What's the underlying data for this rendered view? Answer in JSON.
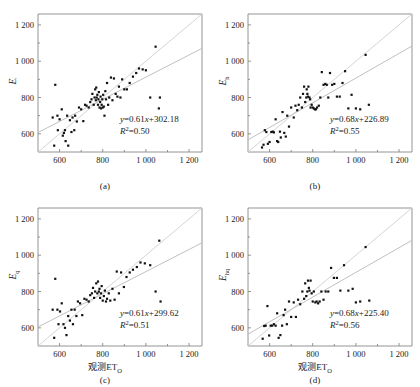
{
  "figure": {
    "axis": {
      "x_ticks": [
        "600",
        "800",
        "1 000",
        "1 200"
      ],
      "y_ticks": [
        "600",
        "800",
        "1 000",
        "1 200"
      ],
      "x_tick_values": [
        600,
        800,
        1000,
        1200
      ],
      "y_tick_values": [
        600,
        800,
        1000,
        1200
      ],
      "xlim": [
        500,
        1260
      ],
      "ylim": [
        500,
        1260
      ],
      "xlabel": "观测ET",
      "xlabel_sub": "O"
    },
    "panels": [
      {
        "id": "a",
        "caption": "(a)",
        "ylabel": "E",
        "ylabel_sub": "′",
        "equation": "y=0.61x+302.18",
        "r2": "R2=0.50",
        "r2_prefix": "R",
        "r2_value": "=0.50"
      },
      {
        "id": "b",
        "caption": "(b)",
        "ylabel": "E",
        "ylabel_sub": "h",
        "equation": "y=0.68x+226.89",
        "r2": "R2=0.55",
        "r2_prefix": "R",
        "r2_value": "=0.55"
      },
      {
        "id": "c",
        "caption": "(c)",
        "ylabel": "E",
        "ylabel_sub": "q",
        "equation": "y=0.61x+299.62",
        "r2": "R2=0.51",
        "r2_prefix": "R",
        "r2_value": "=0.51"
      },
      {
        "id": "d",
        "caption": "(d)",
        "ylabel": "E",
        "ylabel_sub": "hq",
        "equation": "y=0.68x+225.40",
        "r2": "R2=0.56",
        "r2_prefix": "R",
        "r2_value": "=0.56"
      }
    ]
  },
  "chart_data": [
    {
      "type": "scatter",
      "panel": "a",
      "title": "(a)",
      "xlabel": "观测ET_O",
      "ylabel": "E′",
      "xlim": [
        500,
        1260
      ],
      "ylim": [
        500,
        1260
      ],
      "xticks": [
        600,
        800,
        1000,
        1200
      ],
      "yticks": [
        600,
        800,
        1000,
        1200
      ],
      "grid": false,
      "legend": "none",
      "fit": {
        "slope": 0.61,
        "intercept": 302.18,
        "r2": 0.5,
        "label": "y=0.61x+302.18"
      },
      "identity_line": true,
      "x": [
        568,
        575,
        580,
        590,
        592,
        600,
        610,
        615,
        620,
        625,
        628,
        635,
        640,
        648,
        655,
        660,
        668,
        672,
        680,
        690,
        700,
        710,
        718,
        725,
        735,
        742,
        748,
        752,
        758,
        762,
        765,
        768,
        770,
        772,
        775,
        778,
        780,
        782,
        785,
        788,
        790,
        792,
        795,
        798,
        800,
        802,
        805,
        808,
        812,
        815,
        820,
        825,
        830,
        838,
        845,
        852,
        860,
        868,
        875,
        882,
        890,
        900,
        912,
        925,
        940,
        955,
        968,
        985,
        1000,
        1020,
        1045,
        1060,
        1065
      ],
      "y": [
        690,
        535,
        870,
        700,
        620,
        680,
        735,
        590,
        605,
        620,
        560,
        700,
        535,
        675,
        610,
        690,
        620,
        700,
        668,
        745,
        735,
        670,
        760,
        755,
        745,
        775,
        790,
        820,
        760,
        800,
        845,
        785,
        855,
        800,
        815,
        760,
        790,
        830,
        745,
        775,
        805,
        740,
        760,
        790,
        745,
        815,
        750,
        700,
        835,
        790,
        880,
        760,
        800,
        910,
        785,
        905,
        820,
        805,
        860,
        800,
        900,
        845,
        845,
        880,
        915,
        935,
        960,
        955,
        950,
        800,
        1080,
        740,
        800
      ]
    },
    {
      "type": "scatter",
      "panel": "b",
      "title": "(b)",
      "xlabel": "观测ET_O",
      "ylabel": "E_h",
      "xlim": [
        500,
        1260
      ],
      "ylim": [
        500,
        1260
      ],
      "xticks": [
        600,
        800,
        1000,
        1200
      ],
      "yticks": [
        600,
        800,
        1000,
        1200
      ],
      "grid": false,
      "legend": "none",
      "fit": {
        "slope": 0.68,
        "intercept": 226.89,
        "r2": 0.55,
        "label": "y=0.68x+226.89"
      },
      "identity_line": true,
      "x": [
        565,
        572,
        578,
        585,
        592,
        600,
        608,
        615,
        620,
        628,
        635,
        640,
        648,
        652,
        660,
        668,
        675,
        682,
        690,
        700,
        712,
        720,
        728,
        735,
        742,
        750,
        755,
        760,
        765,
        770,
        772,
        775,
        778,
        780,
        785,
        788,
        790,
        795,
        800,
        805,
        810,
        815,
        820,
        828,
        835,
        842,
        850,
        858,
        865,
        872,
        880,
        890,
        900,
        912,
        925,
        938,
        950,
        965,
        980,
        1000,
        1020,
        1045,
        1060
      ],
      "y": [
        525,
        540,
        620,
        610,
        545,
        555,
        610,
        612,
        608,
        680,
        560,
        555,
        612,
        580,
        720,
        605,
        585,
        700,
        640,
        745,
        690,
        755,
        730,
        760,
        800,
        745,
        820,
        860,
        775,
        800,
        845,
        820,
        805,
        860,
        800,
        790,
        745,
        760,
        745,
        740,
        735,
        735,
        745,
        755,
        800,
        940,
        870,
        875,
        870,
        800,
        935,
        870,
        875,
        805,
        805,
        880,
        945,
        740,
        815,
        740,
        735,
        1035,
        760
      ]
    },
    {
      "type": "scatter",
      "panel": "c",
      "title": "(c)",
      "xlabel": "观测ET_O",
      "ylabel": "E_q",
      "xlim": [
        500,
        1260
      ],
      "ylim": [
        500,
        1260
      ],
      "xticks": [
        600,
        800,
        1000,
        1200
      ],
      "yticks": [
        600,
        800,
        1000,
        1200
      ],
      "grid": false,
      "legend": "none",
      "fit": {
        "slope": 0.61,
        "intercept": 299.62,
        "r2": 0.51,
        "label": "y=0.61x+299.62"
      },
      "identity_line": true,
      "x": [
        568,
        575,
        580,
        590,
        595,
        602,
        610,
        618,
        625,
        632,
        640,
        648,
        655,
        662,
        670,
        678,
        685,
        695,
        705,
        715,
        725,
        735,
        742,
        750,
        755,
        760,
        765,
        770,
        775,
        778,
        782,
        785,
        788,
        792,
        795,
        800,
        805,
        810,
        815,
        820,
        828,
        835,
        845,
        855,
        865,
        875,
        885,
        898,
        910,
        925,
        940,
        958,
        975,
        995,
        1020,
        1045,
        1062,
        1068
      ],
      "y": [
        700,
        545,
        870,
        700,
        620,
        690,
        735,
        620,
        600,
        560,
        665,
        640,
        700,
        620,
        700,
        665,
        745,
        735,
        670,
        760,
        755,
        745,
        780,
        790,
        820,
        765,
        800,
        845,
        790,
        855,
        800,
        815,
        765,
        790,
        830,
        750,
        775,
        805,
        745,
        760,
        790,
        750,
        815,
        755,
        910,
        790,
        905,
        825,
        880,
        905,
        920,
        935,
        960,
        955,
        945,
        800,
        1080,
        745
      ]
    },
    {
      "type": "scatter",
      "panel": "d",
      "title": "(d)",
      "xlabel": "观测ET_O",
      "ylabel": "E_hq",
      "xlim": [
        500,
        1260
      ],
      "ylim": [
        500,
        1260
      ],
      "xticks": [
        600,
        800,
        1000,
        1200
      ],
      "yticks": [
        600,
        800,
        1000,
        1200
      ],
      "grid": false,
      "legend": "none",
      "fit": {
        "slope": 0.68,
        "intercept": 225.4,
        "r2": 0.56,
        "label": "y=0.68x+225.40"
      },
      "identity_line": true,
      "x": [
        568,
        575,
        582,
        590,
        598,
        605,
        612,
        620,
        628,
        635,
        642,
        650,
        658,
        665,
        672,
        680,
        690,
        700,
        712,
        722,
        732,
        742,
        752,
        760,
        765,
        770,
        775,
        778,
        782,
        785,
        790,
        795,
        800,
        805,
        812,
        818,
        825,
        832,
        840,
        850,
        860,
        872,
        885,
        898,
        912,
        928,
        945,
        965,
        985,
        1000,
        1020,
        1045,
        1062
      ],
      "y": [
        540,
        610,
        612,
        720,
        558,
        612,
        612,
        620,
        612,
        680,
        545,
        560,
        612,
        670,
        700,
        620,
        745,
        660,
        740,
        660,
        755,
        730,
        800,
        760,
        845,
        775,
        800,
        860,
        820,
        805,
        860,
        790,
        745,
        800,
        740,
        745,
        735,
        745,
        800,
        755,
        800,
        800,
        930,
        875,
        875,
        805,
        945,
        805,
        815,
        740,
        745,
        1045,
        750
      ]
    }
  ]
}
